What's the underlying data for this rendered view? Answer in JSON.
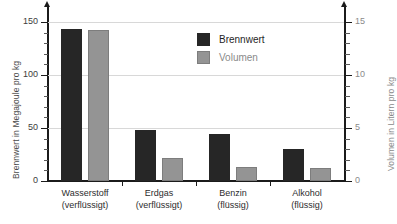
{
  "chart_data": {
    "type": "bar",
    "title": "",
    "categories": [
      "Wasserstoff (verflüssigt)",
      "Erdgas (verflüssigt)",
      "Benzin (flüssig)",
      "Alkohol (flüssig)"
    ],
    "category_lines": [
      [
        "Wasserstoff",
        "(verflüssigt)"
      ],
      [
        "Erdgas",
        "(verflüssigt)"
      ],
      [
        "Benzin",
        "(flüssig)"
      ],
      [
        "Alkohol",
        "(flüssig)"
      ]
    ],
    "series": [
      {
        "name": "Brennwert",
        "axis": "left",
        "unit": "Megajoule pro kg",
        "color": "#262626",
        "values": [
          143,
          48,
          44,
          30
        ]
      },
      {
        "name": "Volumen",
        "axis": "right",
        "unit": "Litern pro kg",
        "color": "#949494",
        "values": [
          14.2,
          2.2,
          1.3,
          1.2
        ]
      }
    ],
    "xlabel": "",
    "ylabel": "Brennwert in Megajoule pro kg",
    "y2label": "Volumen in Litern pro kg",
    "ylim": [
      0,
      150
    ],
    "y2lim": [
      0,
      15
    ],
    "yticks": [
      0,
      50,
      100,
      150
    ],
    "y2ticks": [
      0,
      5,
      10,
      15
    ],
    "yticklabels": [
      "0",
      "50",
      "100",
      "150"
    ],
    "y2ticklabels": [
      "0",
      "5",
      "10",
      "15"
    ],
    "yminorticks": [
      10,
      20,
      30,
      40,
      60,
      70,
      80,
      90,
      110,
      120,
      130,
      140
    ],
    "y2minorticks": [
      1,
      2,
      3,
      4,
      6,
      7,
      8,
      9,
      11,
      12,
      13,
      14
    ],
    "grid": true,
    "grid_axis": "y",
    "legend": {
      "position": "top-center-right",
      "entries": [
        {
          "label": "Brennwert",
          "color": "#262626"
        },
        {
          "label": "Volumen",
          "color": "#949494"
        }
      ]
    }
  },
  "axes": {
    "left": {
      "title": "Brennwert in Megajoule pro kg"
    },
    "right": {
      "title": "Volumen in Litern pro kg"
    }
  }
}
